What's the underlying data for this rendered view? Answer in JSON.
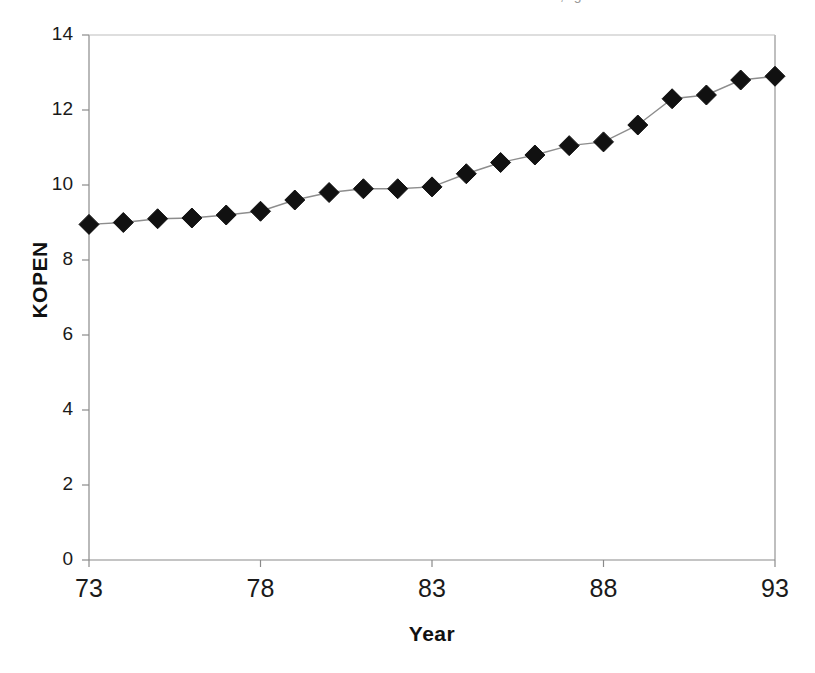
{
  "figure": {
    "top_cut_text": ", g",
    "background_color": "#ffffff",
    "frame_color": "#8a8a8a",
    "axis_color": "#7d7d7d"
  },
  "axes": {
    "y_title": "KOPEN",
    "x_title": "Year",
    "y_ticks": [
      "0",
      "2",
      "4",
      "6",
      "8",
      "10",
      "12",
      "14"
    ],
    "x_ticks": [
      "73",
      "78",
      "83",
      "88",
      "93"
    ]
  },
  "chart_data": {
    "type": "line",
    "title": "",
    "subtitle": "",
    "xlabel": "Year",
    "ylabel": "KOPEN",
    "xlim": [
      73,
      93
    ],
    "ylim": [
      0,
      14
    ],
    "y_tick_step": 2,
    "x_tick_step": 5,
    "grid": false,
    "legend": false,
    "marker": "diamond",
    "marker_color": "#111111",
    "marker_size_px": 20,
    "line_color": "#8d8d8d",
    "line_width_px": 1.4,
    "x": [
      73,
      74,
      75,
      76,
      77,
      78,
      79,
      80,
      81,
      82,
      83,
      84,
      85,
      86,
      87,
      88,
      89,
      90,
      91,
      92,
      93
    ],
    "values": [
      8.95,
      9.0,
      9.1,
      9.12,
      9.2,
      9.3,
      9.6,
      9.8,
      9.9,
      9.9,
      9.95,
      10.3,
      10.6,
      10.8,
      11.05,
      11.15,
      11.6,
      12.3,
      12.4,
      12.8,
      12.9
    ],
    "series": [
      {
        "name": "KOPEN",
        "values": [
          8.95,
          9.0,
          9.1,
          9.12,
          9.2,
          9.3,
          9.6,
          9.8,
          9.9,
          9.9,
          9.95,
          10.3,
          10.6,
          10.8,
          11.05,
          11.15,
          11.6,
          12.3,
          12.4,
          12.8,
          12.9
        ]
      }
    ]
  }
}
